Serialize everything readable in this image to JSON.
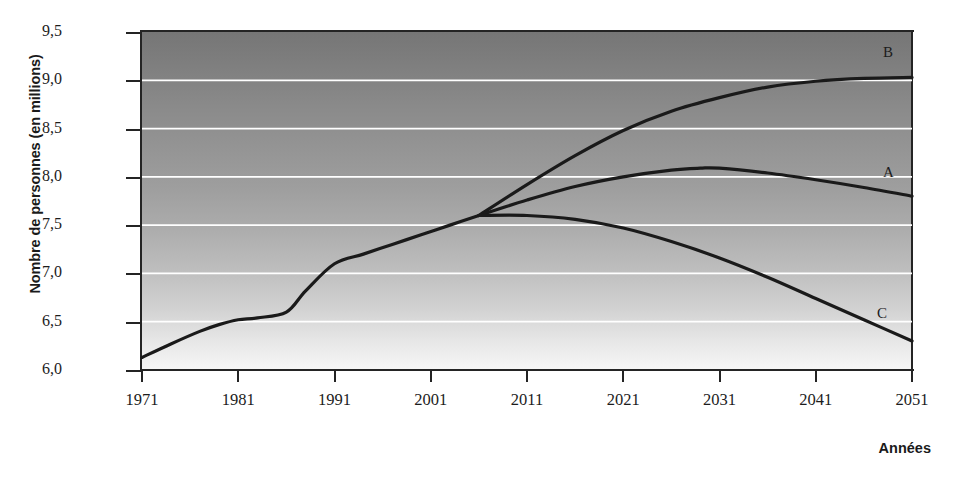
{
  "chart_data": {
    "type": "line",
    "title": "",
    "xlabel": "Années",
    "ylabel": "Nombre de personnes (en millions)",
    "xlim": [
      1971,
      2051
    ],
    "ylim": [
      6.0,
      9.5
    ],
    "grid": true,
    "gridline_color": "#ffffff",
    "legend_position": "inline-right",
    "line_color": "#1a1a1a",
    "background": "vertical-gradient-gray",
    "xticks": [
      1971,
      1981,
      1991,
      2001,
      2011,
      2021,
      2031,
      2041,
      2051
    ],
    "xtick_labels": [
      "1971",
      "1981",
      "1991",
      "2001",
      "2011",
      "2021",
      "2031",
      "2041",
      "2051"
    ],
    "yticks": [
      6.0,
      6.5,
      7.0,
      7.5,
      8.0,
      8.5,
      9.0,
      9.5
    ],
    "ytick_labels": [
      "6,0",
      "6,5",
      "7,0",
      "7,5",
      "8,0",
      "8,5",
      "9,0",
      "9,5"
    ],
    "branch_point": {
      "x": 2006,
      "y": 7.6
    },
    "series": [
      {
        "name": "Historique",
        "label": "",
        "x": [
          1971,
          1974,
          1977,
          1979,
          1981,
          1983,
          1986,
          1988,
          1991,
          1994,
          1997,
          2000,
          2003,
          2006
        ],
        "values": [
          6.13,
          6.27,
          6.4,
          6.47,
          6.52,
          6.54,
          6.6,
          6.82,
          7.1,
          7.2,
          7.3,
          7.4,
          7.5,
          7.6
        ]
      },
      {
        "name": "B",
        "label": "B",
        "x": [
          2006,
          2011,
          2016,
          2021,
          2026,
          2031,
          2036,
          2041,
          2046,
          2051
        ],
        "values": [
          7.6,
          7.92,
          8.22,
          8.48,
          8.68,
          8.82,
          8.93,
          8.99,
          9.02,
          9.03
        ]
      },
      {
        "name": "A",
        "label": "A",
        "x": [
          2006,
          2011,
          2016,
          2021,
          2026,
          2029,
          2031,
          2036,
          2041,
          2046,
          2051
        ],
        "values": [
          7.6,
          7.76,
          7.9,
          8.0,
          8.07,
          8.09,
          8.09,
          8.04,
          7.97,
          7.89,
          7.8
        ]
      },
      {
        "name": "C",
        "label": "C",
        "x": [
          2006,
          2011,
          2016,
          2021,
          2026,
          2031,
          2036,
          2041,
          2046,
          2051
        ],
        "values": [
          7.6,
          7.6,
          7.56,
          7.47,
          7.33,
          7.16,
          6.96,
          6.74,
          6.52,
          6.3
        ]
      }
    ]
  },
  "axes": {
    "y_title": "Nombre de personnes (en millions)",
    "x_title": "Années"
  },
  "curve_labels": {
    "b": "B",
    "a": "A",
    "c": "C"
  }
}
